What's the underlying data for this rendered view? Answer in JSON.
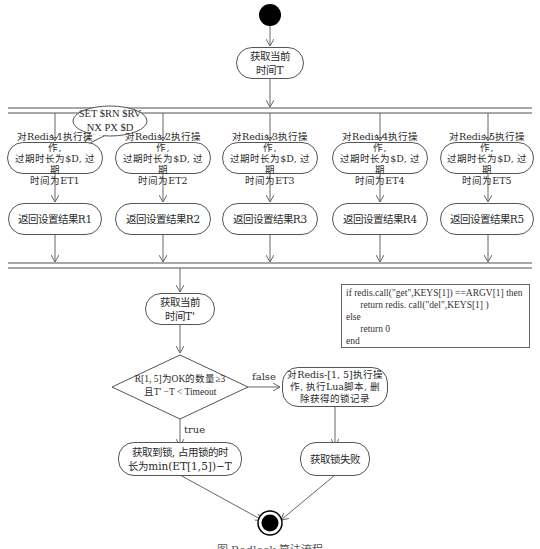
{
  "diagram": {
    "start_node": "start",
    "get_time_T": [
      "获取当前",
      "时间T"
    ],
    "callout": [
      "SET $RN $RV",
      "NX PX $D"
    ],
    "set_ops": [
      {
        "lines": [
          "对Redis-1执行操作,",
          "过期时长为$D, 过期",
          "时间为ET1"
        ],
        "result": "返回设置结果R1"
      },
      {
        "lines": [
          "对Redis-2执行操作,",
          "过期时长为$D, 过期",
          "时间为ET2"
        ],
        "result": "返回设置结果R2"
      },
      {
        "lines": [
          "对Redis-3执行操作,",
          "过期时长为$D, 过期",
          "时间为ET3"
        ],
        "result": "返回设置结果R3"
      },
      {
        "lines": [
          "对Redis-4执行操作,",
          "过期时长为$D, 过期",
          "时间为ET4"
        ],
        "result": "返回设置结果R4"
      },
      {
        "lines": [
          "对Redis-5执行操作,",
          "过期时长为$D, 过期",
          "时间为ET5"
        ],
        "result": "返回设置结果R5"
      }
    ],
    "get_time_T2": [
      "获取当前",
      "时间T'"
    ],
    "lua_script": [
      "if redis.call(\"get\",KEYS[1]) ==ARGV[1] then",
      "      return redis. call(\"del\",KEYS[1] )",
      "else",
      "      return 0",
      "end"
    ],
    "decision": [
      "R[1, 5]为OK的数量≥3",
      "且T' −T < Timeout"
    ],
    "false_label": "false",
    "true_label": "true",
    "unlock_all": [
      "对Redis-[1, 5]执行操",
      "作, 执行Lua脚本, 删",
      "除获得的锁记录"
    ],
    "acquired": [
      "获取到锁, 占用锁的时",
      "长为min(ET[1,5])−T"
    ],
    "failed": "获取锁失败",
    "end_node": "end",
    "caption": "图  Redlock 算法流程"
  }
}
